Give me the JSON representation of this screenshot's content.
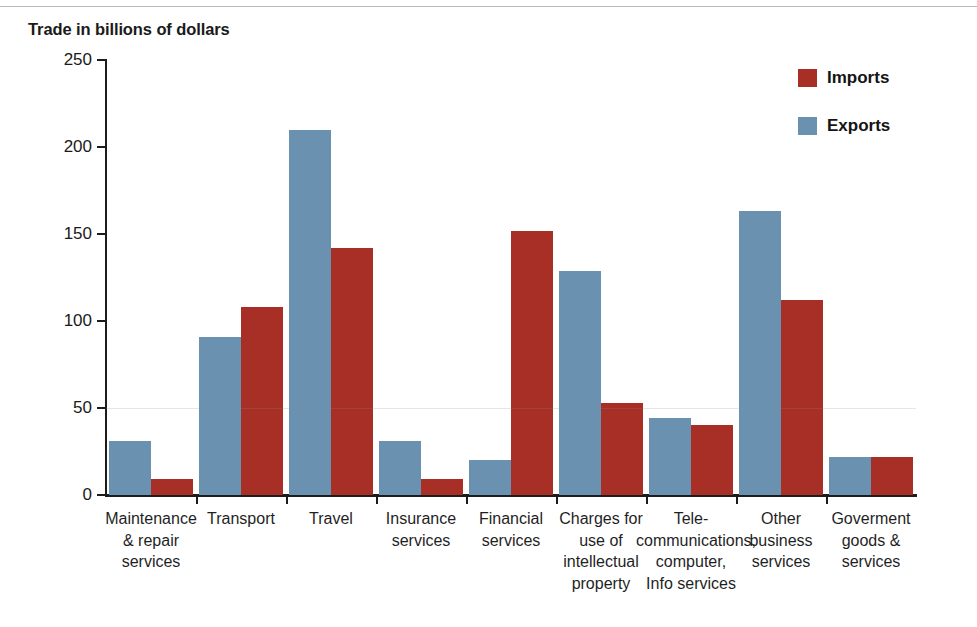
{
  "chart_data": {
    "type": "bar",
    "title": "Trade in billions of dollars",
    "xlabel": "",
    "ylabel": "Trade in billions of dollars",
    "ylim": [
      0,
      250
    ],
    "yticks": [
      0,
      50,
      100,
      150,
      200,
      250
    ],
    "grid": false,
    "legend_position": "top-right",
    "categories": [
      "Maintenance & repair services",
      "Transport",
      "Travel",
      "Insurance services",
      "Financial services",
      "Charges for use of intellectual property",
      "Tele-communications, computer, Info services",
      "Other business services",
      "Goverment goods & services"
    ],
    "category_label_lines": [
      [
        "Maintenance",
        "& repair",
        "services"
      ],
      [
        "Transport"
      ],
      [
        "Travel"
      ],
      [
        "Insurance",
        "services"
      ],
      [
        "Financial",
        "services"
      ],
      [
        "Charges for",
        "use of",
        "intellectual",
        "property"
      ],
      [
        "Tele-",
        "communications,",
        "computer,",
        "Info services"
      ],
      [
        "Other",
        "business",
        "services"
      ],
      [
        "Goverment",
        "goods &",
        "services"
      ]
    ],
    "series": [
      {
        "name": "Exports",
        "color": "#6a92b0",
        "values": [
          31,
          91,
          210,
          31,
          20,
          129,
          44,
          163,
          22
        ]
      },
      {
        "name": "Imports",
        "color": "#a82f25",
        "values": [
          9,
          108,
          142,
          9,
          152,
          53,
          40,
          112,
          22
        ]
      }
    ]
  },
  "legend": {
    "items": [
      {
        "label": "Imports",
        "color": "#a82f25"
      },
      {
        "label": "Exports",
        "color": "#6a92b0"
      }
    ]
  },
  "axis": {
    "y_tick_labels": [
      "250",
      "200",
      "150",
      "100",
      "50",
      "0"
    ]
  }
}
